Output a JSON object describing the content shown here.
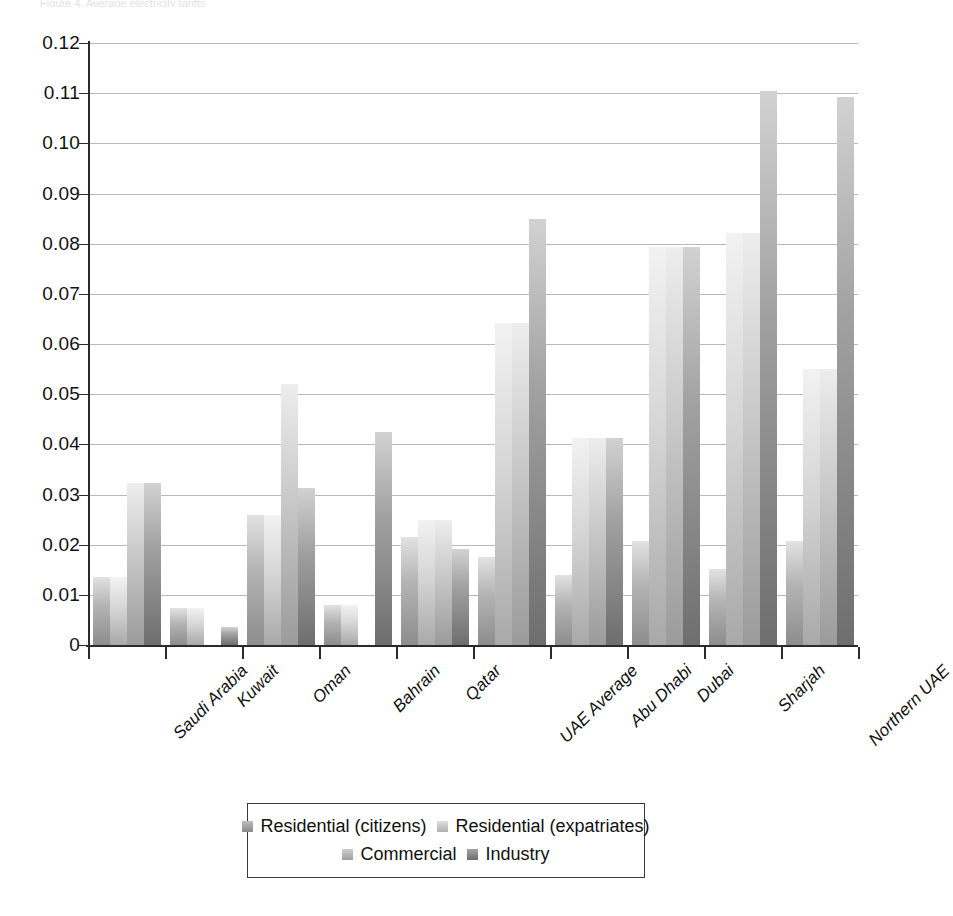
{
  "figure": {
    "top_clipped_caption": "Figure 4. Average electricity tariffs"
  },
  "axis": {
    "ylabel": "US$ per kWh",
    "yticks": [
      "0",
      "0.01",
      "0.02",
      "0.03",
      "0.04",
      "0.05",
      "0.06",
      "0.07",
      "0.08",
      "0.09",
      "0.10",
      "0.11",
      "0.12"
    ]
  },
  "legend": {
    "rows": [
      [
        {
          "label": "Residential (citizens)",
          "swatch": "series-0-swatch"
        },
        {
          "label": "Residential (expatriates)",
          "swatch": "series-1-swatch"
        }
      ],
      [
        {
          "label": "Commercial",
          "swatch": "series-2-swatch"
        },
        {
          "label": "Industry",
          "swatch": "series-3-swatch"
        }
      ]
    ]
  },
  "chart_data": {
    "type": "bar",
    "title": "",
    "subtitle": "",
    "xlabel": "",
    "ylabel": "US$ per kWh",
    "ylim": [
      0,
      0.12
    ],
    "ytick_step": 0.01,
    "grid": true,
    "legend_position": "bottom",
    "grouping": "grouped",
    "categories": [
      "Saudi Arabia",
      "Kuwait",
      "Oman",
      "Bahrain",
      "Qatar",
      "UAE Average",
      "Abu Dhabi",
      "Dubai",
      "Sharjah",
      "Northern UAE"
    ],
    "series": [
      {
        "name": "Residential (citizens)",
        "color": "#b4b4b4",
        "values": [
          0.0135,
          0.0074,
          0.026,
          0.008,
          0.0215,
          0.0175,
          0.014,
          0.0207,
          0.0152,
          0.0207
        ]
      },
      {
        "name": "Residential (expatriates)",
        "color": "#d6d6d6",
        "values": [
          0.0135,
          0.0074,
          0.026,
          0.008,
          0.025,
          0.0642,
          0.0412,
          0.0793,
          0.0822,
          0.055
        ]
      },
      {
        "name": "Commercial",
        "color": "#c8c8c8",
        "values": [
          0.0322,
          0.0,
          0.052,
          0.0,
          0.025,
          0.0642,
          0.0412,
          0.0793,
          0.0822,
          0.055
        ]
      },
      {
        "name": "Industry",
        "color": "#a1a1a1",
        "values": [
          0.0322,
          0.0035,
          0.0313,
          0.0425,
          0.0192,
          0.0849,
          0.0412,
          0.0793,
          0.1105,
          0.1093
        ]
      }
    ]
  }
}
